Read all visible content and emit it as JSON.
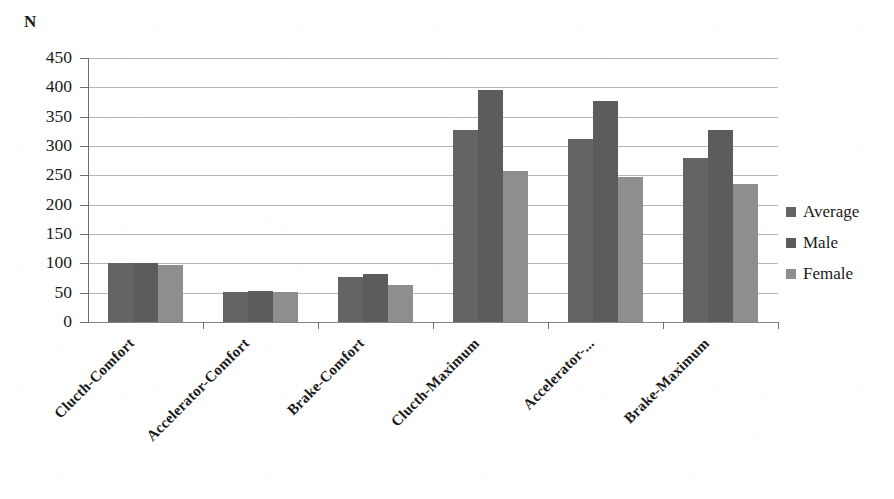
{
  "chart_data": {
    "type": "bar",
    "title": "",
    "xlabel": "",
    "ylabel": "N",
    "ylim": [
      0,
      450
    ],
    "ytick_step": 50,
    "grid": true,
    "legend_position": "right",
    "categories": [
      "Clucth-Comfort",
      "Accelerator-Comfort",
      "Brake-Comfort",
      "Clucth-Maximum",
      "Accelerator-...",
      "Brake-Maximum"
    ],
    "ytick_labels": [
      "450",
      "400",
      "350",
      "300",
      "250",
      "200",
      "150",
      "100",
      "50",
      "0"
    ],
    "ytick_values": [
      450,
      400,
      350,
      300,
      250,
      200,
      150,
      100,
      50,
      0
    ],
    "series": [
      {
        "name": "Average",
        "color": "#646464",
        "values": [
          100,
          52,
          77,
          328,
          312,
          280
        ]
      },
      {
        "name": "Male",
        "color": "#5c5c5c",
        "values": [
          100,
          53,
          82,
          396,
          376,
          328
        ]
      },
      {
        "name": "Female",
        "color": "#8e8e8e",
        "values": [
          98,
          52,
          63,
          257,
          248,
          235
        ]
      }
    ]
  },
  "legend": {
    "items": [
      {
        "label": "Average",
        "color": "#646464"
      },
      {
        "label": "Male",
        "color": "#5c5c5c"
      },
      {
        "label": "Female",
        "color": "#8e8e8e"
      }
    ]
  },
  "axis": {
    "y_title": "N"
  }
}
